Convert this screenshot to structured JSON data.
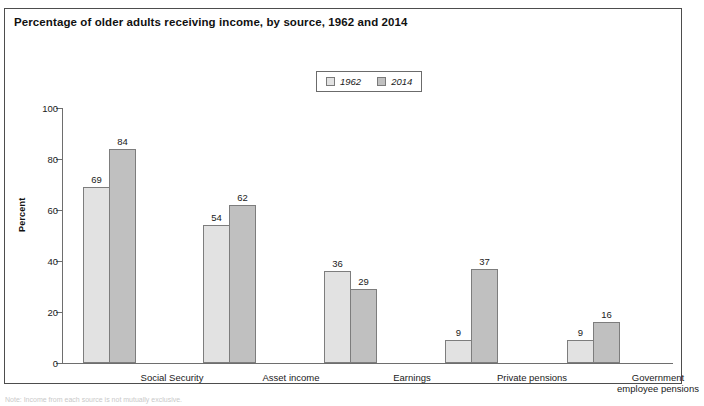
{
  "figure": {
    "title": "Percentage of older adults receiving income, by source, 1962 and 2014",
    "footnote": "Note: Income from each source is not mutually exclusive."
  },
  "legend": {
    "position": "top-center",
    "items": [
      {
        "label": "1962",
        "color": "#e2e2e2"
      },
      {
        "label": "2014",
        "color": "#c0c0c0"
      }
    ]
  },
  "axes": {
    "y_title": "Percent",
    "y_ticks": [
      "0",
      "20",
      "40",
      "60",
      "80",
      "100"
    ]
  },
  "chart_data": {
    "type": "bar",
    "title": "Percentage of older adults receiving income, by source, 1962 and 2014",
    "xlabel": "",
    "ylabel": "Percent",
    "ylim": [
      0,
      100
    ],
    "yticks": [
      0,
      20,
      40,
      60,
      80,
      100
    ],
    "grid": false,
    "legend_position": "top-center",
    "categories": [
      "Social Security",
      "Asset income",
      "Earnings",
      "Private pensions",
      "Government\nemployee pensions"
    ],
    "series": [
      {
        "name": "1962",
        "color": "#e2e2e2",
        "values": [
          69,
          54,
          36,
          9,
          9
        ]
      },
      {
        "name": "2014",
        "color": "#c0c0c0",
        "values": [
          84,
          62,
          29,
          37,
          16
        ]
      }
    ]
  }
}
